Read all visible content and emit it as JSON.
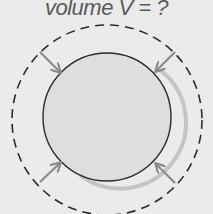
{
  "caption": {
    "prefix": "volume ",
    "variable": "V",
    "suffix": " = ?"
  },
  "diagram": {
    "outer_circle": {
      "style": "dashed",
      "meaning": "original volume"
    },
    "inner_circle": {
      "style": "solid",
      "meaning": "compressed sphere"
    },
    "arrows": [
      "upper-left-inward",
      "upper-right-inward",
      "lower-left-inward",
      "lower-right-inward"
    ],
    "colors": {
      "background": "#ebebeb",
      "outline": "#2a2a2a",
      "arrow": "#8a8a8a",
      "sphere_fill": "#dedede",
      "sphere_shadow": "#c4c4c4"
    }
  }
}
